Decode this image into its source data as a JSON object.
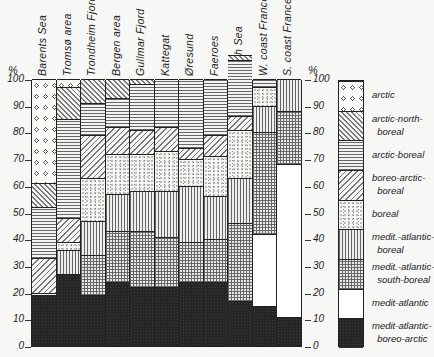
{
  "chart_data": {
    "type": "bar",
    "stacked": true,
    "title": "",
    "xlabel": "",
    "ylabel": "%",
    "ylim": [
      0,
      100
    ],
    "yticks": [
      0,
      10,
      20,
      30,
      40,
      50,
      60,
      70,
      80,
      90,
      100
    ],
    "grid": false,
    "legend_position": "right",
    "categories": [
      "Barents Sea",
      "Tromsø area",
      "Trondheim Fjord",
      "Bergen area",
      "Gullmar Fjord",
      "Kattegat",
      "Øresund",
      "Faeroes",
      "North Sea",
      "W. coast France",
      "S. coast France"
    ],
    "series": [
      {
        "name": "medit-atlantic-boreo-arctic",
        "values": [
          19,
          27,
          19,
          24,
          22,
          22,
          24,
          24,
          17,
          15,
          11
        ]
      },
      {
        "name": "medit-atlantic",
        "values": [
          0,
          0,
          0,
          0,
          0,
          0,
          0,
          0,
          0,
          27,
          57
        ]
      },
      {
        "name": "medit-atlantic-south-boreal",
        "values": [
          0,
          0,
          15,
          19,
          21,
          19,
          15,
          16,
          29,
          38,
          20
        ]
      },
      {
        "name": "medit-atlantic-boreal",
        "values": [
          0,
          9,
          13,
          14,
          15,
          17,
          21,
          16,
          17,
          10,
          12
        ]
      },
      {
        "name": "boreal",
        "values": [
          1,
          3,
          16,
          15,
          14,
          15,
          10,
          15,
          18,
          7,
          0
        ]
      },
      {
        "name": "boreo-arctic-boreal",
        "values": [
          13,
          9,
          16,
          10,
          9,
          9,
          4,
          8,
          5,
          0,
          0
        ]
      },
      {
        "name": "arctic-boreal",
        "values": [
          19,
          37,
          12,
          11,
          17,
          18,
          26,
          21,
          21,
          3,
          0
        ]
      },
      {
        "name": "arctic-north-boreal",
        "values": [
          9,
          12,
          9,
          7,
          2,
          0,
          0,
          0,
          2,
          0,
          0
        ]
      },
      {
        "name": "arctic",
        "values": [
          39,
          3,
          0,
          0,
          0,
          0,
          0,
          0,
          0,
          0,
          0
        ]
      }
    ],
    "legend": [
      {
        "key": "arctic",
        "label": "arctic"
      },
      {
        "key": "arctic-north-boreal",
        "label": "arctic-north-\nboreal"
      },
      {
        "key": "arctic-boreal",
        "label": "arctic-boreal"
      },
      {
        "key": "boreo-arctic-boreal",
        "label": "boreo-arctic-\nboreal"
      },
      {
        "key": "boreal",
        "label": "boreal"
      },
      {
        "key": "medit-atlantic-boreal",
        "label": "medit.-atlantic-\nboreal"
      },
      {
        "key": "medit-atlantic-south-boreal",
        "label": "medit.-atlantic-\nsouth-boreal"
      },
      {
        "key": "medit-atlantic",
        "label": "medit-atlantic"
      },
      {
        "key": "medit-atlantic-boreo-arctic",
        "label": "medit-atlantic-\nboreo-arctic"
      }
    ]
  },
  "axis": {
    "unit_left": "%",
    "unit_right": "%",
    "tick_labels": [
      "0",
      "10",
      "20",
      "30",
      "40",
      "50",
      "60",
      "70",
      "80",
      "90",
      "100"
    ]
  },
  "category_labels": [
    "Barents Sea",
    "Tromsø area",
    "Trondheim Fjord",
    "Bergen area",
    "Gullmar Fjord",
    "Kattegat",
    "Øresund",
    "Faeroes",
    "North Sea",
    "W. coast France",
    "S. coast France"
  ]
}
